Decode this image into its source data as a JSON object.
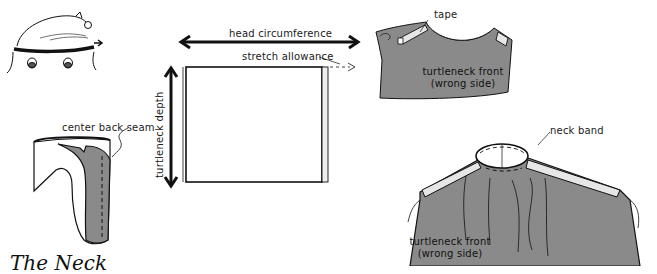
{
  "figure": {
    "title": "The Neck",
    "colors": {
      "fabric": "#8a8a8a",
      "ink": "#111111",
      "tape": "#e6e6e6",
      "background": "#ffffff"
    }
  },
  "panels": {
    "head": {
      "icon": "head-measure-icon"
    },
    "rectangle": {
      "width_label": "head circumference",
      "height_label": "turtleneck depth",
      "allowance_label": "stretch allowance"
    },
    "folded_collar": {
      "label": "center back seam"
    },
    "front_tape": {
      "tape_label": "tape",
      "body_label_line1": "turtleneck front",
      "body_label_line2": "(wrong side)"
    },
    "front_band": {
      "band_label": "neck band",
      "body_label_line1": "turtleneck front",
      "body_label_line2": "(wrong side)"
    }
  }
}
